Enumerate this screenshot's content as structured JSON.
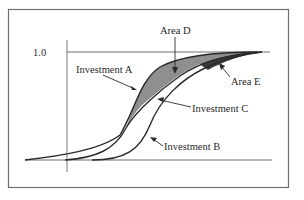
{
  "diagram": {
    "type": "cumulative-distribution-comparison",
    "y_tick_label": "1.0",
    "labels": {
      "investment_a": "Investment A",
      "investment_b": "Investment B",
      "investment_c": "Investment C",
      "area_d": "Area D",
      "area_e": "Area E"
    },
    "colors": {
      "frame": "#6e6e6e",
      "curve": "#2a2a2a",
      "area_d_fill": "#8f8f8f",
      "area_e_fill": "#3a3a3a",
      "axis": "#7a7a7a"
    }
  }
}
